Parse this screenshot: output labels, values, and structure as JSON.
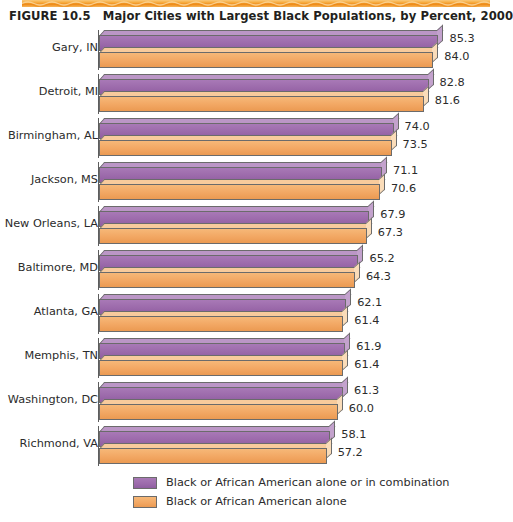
{
  "figure": {
    "number_label": "FIGURE 10.5",
    "title": "Major Cities with Largest Black Populations, by Percent, 2000",
    "top_band_color": "#f2a33a"
  },
  "legend": {
    "position": "bottom-left",
    "items": [
      {
        "label": "Black or African American alone or in combination",
        "color": "#9c6aab",
        "swatch_name": "legend-swatch-combination"
      },
      {
        "label": "Black or African American alone",
        "color": "#f2a763",
        "swatch_name": "legend-swatch-alone"
      }
    ]
  },
  "chart_data": {
    "type": "bar",
    "orientation": "horizontal",
    "title": "Major Cities with Largest Black Populations, by Percent, 2000",
    "xlabel": "",
    "ylabel": "",
    "xlim": [
      0,
      90
    ],
    "grid": false,
    "legend_position": "bottom-left",
    "value_format": "one-decimal-percent",
    "categories": [
      "Gary, IN",
      "Detroit, MI",
      "Birmingham, AL",
      "Jackson, MS",
      "New Orleans, LA",
      "Baltimore, MD",
      "Atlanta, GA",
      "Memphis, TN",
      "Washington, DC",
      "Richmond, VA"
    ],
    "series": [
      {
        "name": "Black or African American alone or in combination",
        "color": "#9c6aab",
        "values": [
          85.3,
          82.8,
          74.0,
          71.1,
          67.9,
          65.2,
          62.1,
          61.9,
          61.3,
          58.1
        ]
      },
      {
        "name": "Black or African American alone",
        "color": "#f2a763",
        "values": [
          84.0,
          81.6,
          73.5,
          70.6,
          67.3,
          64.3,
          61.4,
          61.4,
          60.0,
          57.2
        ]
      }
    ],
    "value_labels": [
      {
        "category": "Gary, IN",
        "combination": "85.3",
        "alone": "84.0"
      },
      {
        "category": "Detroit, MI",
        "combination": "82.8",
        "alone": "81.6"
      },
      {
        "category": "Birmingham, AL",
        "combination": "74.0",
        "alone": "73.5"
      },
      {
        "category": "Jackson, MS",
        "combination": "71.1",
        "alone": "70.6"
      },
      {
        "category": "New Orleans, LA",
        "combination": "67.9",
        "alone": "67.3"
      },
      {
        "category": "Baltimore, MD",
        "combination": "65.2",
        "alone": "64.3"
      },
      {
        "category": "Atlanta, GA",
        "combination": "62.1",
        "alone": "61.4"
      },
      {
        "category": "Memphis, TN",
        "combination": "61.9",
        "alone": "61.4"
      },
      {
        "category": "Washington, DC",
        "combination": "61.3",
        "alone": "60.0"
      },
      {
        "category": "Richmond, VA",
        "combination": "58.1",
        "alone": "57.2"
      }
    ]
  }
}
